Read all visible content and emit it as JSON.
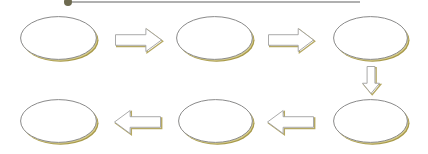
{
  "diagram": {
    "type": "cyclic-process-flow",
    "colors": {
      "background": "#ffffff",
      "outline": "#8a8a8a",
      "shadow": "#a89a4a",
      "shadow_light": "#d6cc8e",
      "fill": "#ffffff",
      "arrow_outline": "#a0a0a0",
      "arrow_shade": "#b5a862",
      "header_line": "#b0b0b0",
      "header_dot": "#6e6a50"
    },
    "header": {
      "dot": {
        "x": 68,
        "y": 2,
        "r": 4
      },
      "line": {
        "x1": 72,
        "x2": 360,
        "y": 1
      }
    },
    "nodes": [
      {
        "id": "node-1",
        "label": "",
        "x": 20,
        "y": 16,
        "w": 77,
        "h": 44,
        "row": "top"
      },
      {
        "id": "node-2",
        "label": "",
        "x": 176,
        "y": 16,
        "w": 77,
        "h": 44,
        "row": "top"
      },
      {
        "id": "node-3",
        "label": "",
        "x": 333,
        "y": 16,
        "w": 75,
        "h": 44,
        "row": "top"
      },
      {
        "id": "node-4",
        "label": "",
        "x": 333,
        "y": 99,
        "w": 75,
        "h": 44,
        "row": "bottom"
      },
      {
        "id": "node-5",
        "label": "",
        "x": 178,
        "y": 99,
        "w": 75,
        "h": 44,
        "row": "bottom"
      },
      {
        "id": "node-6",
        "label": "",
        "x": 20,
        "y": 99,
        "w": 77,
        "h": 44,
        "row": "bottom"
      }
    ],
    "arrows": [
      {
        "id": "arrow-1-2",
        "from": "node-1",
        "to": "node-2",
        "direction": "right",
        "x": 115,
        "y": 28,
        "w": 47,
        "h": 24
      },
      {
        "id": "arrow-2-3",
        "from": "node-2",
        "to": "node-3",
        "direction": "right",
        "x": 268,
        "y": 28,
        "w": 46,
        "h": 24
      },
      {
        "id": "arrow-3-4",
        "from": "node-3",
        "to": "node-4",
        "direction": "down",
        "x": 362,
        "y": 66,
        "w": 18,
        "h": 28
      },
      {
        "id": "arrow-4-5",
        "from": "node-4",
        "to": "node-5",
        "direction": "left",
        "x": 267,
        "y": 110,
        "w": 47,
        "h": 24
      },
      {
        "id": "arrow-5-6",
        "from": "node-5",
        "to": "node-6",
        "direction": "left",
        "x": 114,
        "y": 110,
        "w": 47,
        "h": 24
      }
    ]
  }
}
